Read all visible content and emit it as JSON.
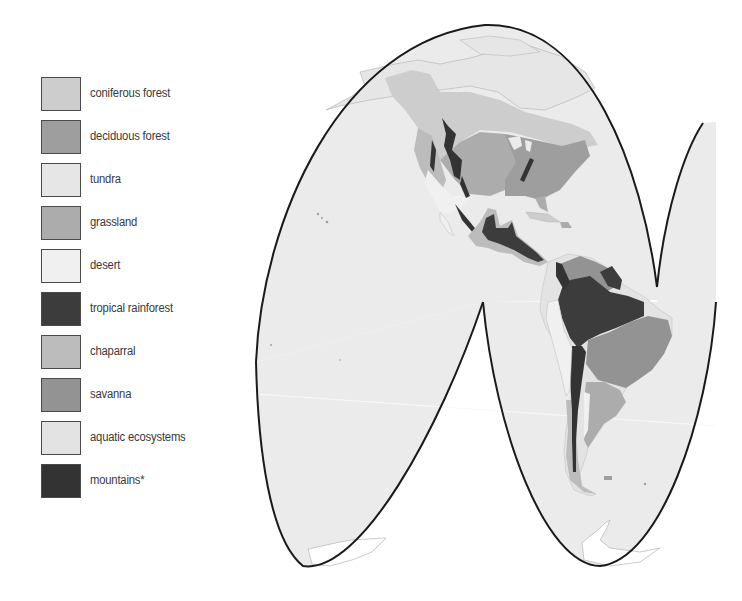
{
  "legend": {
    "items": [
      {
        "label": "coniferous forest",
        "color": "#cdcdcd"
      },
      {
        "label": "deciduous forest",
        "color": "#9e9e9e"
      },
      {
        "label": "tundra",
        "color": "#e6e6e6"
      },
      {
        "label": "grassland",
        "color": "#acacac"
      },
      {
        "label": "desert",
        "color": "#f0f0f0"
      },
      {
        "label": "tropical rainforest",
        "color": "#3c3c3c"
      },
      {
        "label": "chaparral",
        "color": "#bcbcbc"
      },
      {
        "label": "savanna",
        "color": "#939393"
      },
      {
        "label": "aquatic ecosystems",
        "color": "#e3e3e3"
      },
      {
        "label": "mountains*",
        "color": "#333333"
      }
    ]
  },
  "map": {
    "projection": "interrupted-homolosine",
    "ocean_color": "#ebebeb",
    "outline_color": "#1a1a1a",
    "regions_shown": [
      "North America",
      "Central America",
      "South America",
      "Antarctica"
    ]
  }
}
